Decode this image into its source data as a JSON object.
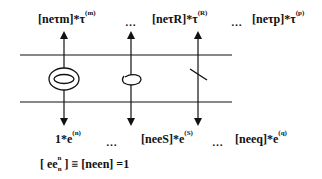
{
  "diagram": {
    "top_labels": [
      {
        "base": "[neτm]*τ",
        "sup": "(m)"
      },
      {
        "base": "[neτR]*τ",
        "sup": "(R)"
      },
      {
        "base": "[neτp]*τ",
        "sup": "(p)"
      }
    ],
    "top_ellipsis": [
      "…",
      "…"
    ],
    "bottom_labels": [
      {
        "base": "1*e",
        "sup": "(n)"
      },
      {
        "base": "[neeS]*e",
        "sup": "(S)"
      },
      {
        "base": "[neeq]*e",
        "sup": "(q)"
      }
    ],
    "bottom_ellipsis": [
      "…",
      "…"
    ],
    "equation": {
      "left_open": "[ ee",
      "left_sub": "n",
      "left_sup": "n",
      "rest": "] ≡ [neen] =1"
    },
    "lines": {
      "horizontal_y": [
        55,
        102
      ],
      "vertical_x": [
        64,
        131,
        198
      ]
    },
    "symbols": [
      {
        "name": "double-ellipse-icon",
        "x": 64
      },
      {
        "name": "open-loop-icon",
        "x": 131
      },
      {
        "name": "slash-mark-icon",
        "x": 198
      }
    ],
    "colors": {
      "stroke": "#111111",
      "background": "#ffffff"
    }
  }
}
